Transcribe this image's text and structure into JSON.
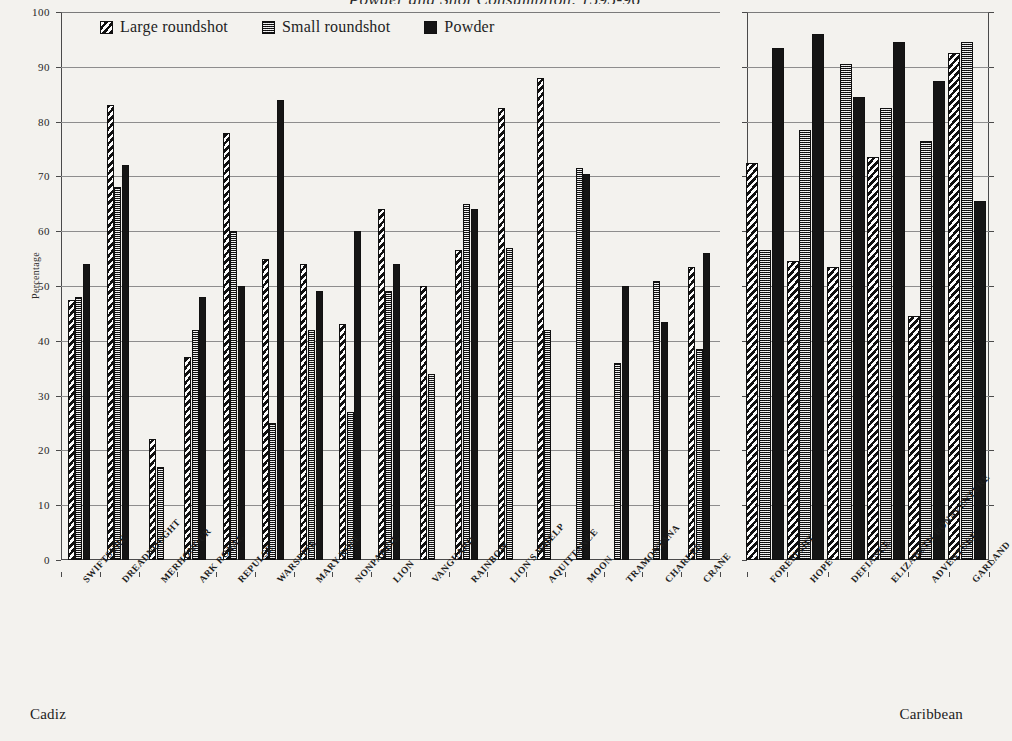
{
  "title": "Powder and Shot Consumption, 1595-96",
  "legend": {
    "items": [
      {
        "label": "Large roundshot",
        "key": "large",
        "swatch": "diagonal-stripe-swatch"
      },
      {
        "label": "Small roundshot",
        "key": "small",
        "swatch": "checker-swatch"
      },
      {
        "label": "Powder",
        "key": "powder",
        "swatch": "solid-black-swatch"
      }
    ]
  },
  "captions": {
    "left": "Cadiz",
    "right": "Caribbean"
  },
  "chart_data": {
    "type": "bar",
    "title": "Powder and Shot Consumption, 1595-96",
    "xlabel": "",
    "ylabel": "Percentage",
    "ylim": [
      0,
      100
    ],
    "yticks": [
      0,
      10,
      20,
      30,
      40,
      50,
      60,
      70,
      80,
      90,
      100
    ],
    "ytick_labels": [
      "0",
      "10",
      "20",
      "30",
      "40",
      "50",
      "60",
      "70",
      "80",
      "90",
      "100"
    ],
    "grid": true,
    "legend_position": "top-left-inside",
    "series_names": [
      "Large roundshot",
      "Small roundshot",
      "Powder"
    ],
    "panels": [
      {
        "name": "Cadiz",
        "categories": [
          "SWIFTSURE",
          "DREADNOUGHT",
          "MERHONOUR",
          "ARK ROYAL",
          "REPULSE",
          "WARSPITE",
          "MARY ROSE",
          "NONPAREIL",
          "LION",
          "VANGUARD",
          "RAINBOW",
          "LION'S WHELP",
          "AQUITTANCE",
          "MOON",
          "TRAMONTANA",
          "CHARLES",
          "CRANE"
        ],
        "series": [
          {
            "name": "Large roundshot",
            "values": [
              47.5,
              83,
              22,
              37,
              78,
              55,
              54,
              43,
              64,
              50,
              56.5,
              82.5,
              88,
              null,
              null,
              null,
              53.5
            ]
          },
          {
            "name": "Small roundshot",
            "values": [
              48,
              68,
              17,
              42,
              60,
              25,
              42,
              27,
              49,
              34,
              65,
              57,
              42,
              71.5,
              36,
              51,
              38.5
            ]
          },
          {
            "name": "Powder",
            "values": [
              54,
              72,
              null,
              48,
              50,
              84,
              49,
              60,
              54,
              null,
              64,
              null,
              null,
              70.5,
              50,
              43.5,
              56
            ]
          }
        ]
      },
      {
        "name": "Caribbean",
        "categories": [
          "FORESIGHT",
          "HOPE",
          "DEFIANCE",
          "ELIZABETH BONAVENTURE",
          "ADVENTURE",
          "GARLAND"
        ],
        "series": [
          {
            "name": "Large roundshot",
            "values": [
              72.5,
              54.5,
              53.5,
              73.5,
              44.5,
              92.5
            ]
          },
          {
            "name": "Small roundshot",
            "values": [
              56.5,
              78.5,
              90.5,
              82.5,
              76.5,
              94.5
            ]
          },
          {
            "name": "Powder",
            "values": [
              93.5,
              96,
              84.5,
              94.5,
              87.5,
              65.5
            ]
          }
        ]
      }
    ]
  }
}
